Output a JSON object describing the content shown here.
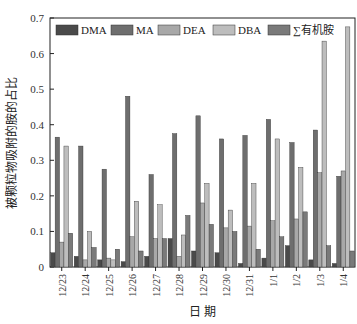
{
  "chart_data": {
    "type": "bar",
    "title": "",
    "xlabel": "日 期",
    "ylabel": "被颗粒物吸附的胺的占比",
    "ylim": [
      0,
      0.7
    ],
    "yticks": [
      0,
      0.1,
      0.2,
      0.3,
      0.4,
      0.5,
      0.6,
      0.7
    ],
    "grid": false,
    "legend_position": "top-inside",
    "categories": [
      "12/23",
      "12/24",
      "12/25",
      "12/26",
      "12/27",
      "12/28",
      "12/29",
      "12/30",
      "12/31",
      "1/1",
      "1/2",
      "1/3",
      "1/4"
    ],
    "series": [
      {
        "name": "DMA",
        "color": "#4a4a4a",
        "values": [
          0.04,
          0.03,
          0.02,
          0.015,
          0.03,
          0.08,
          0.045,
          0.04,
          0.01,
          0.025,
          0.06,
          0.02,
          0.01
        ]
      },
      {
        "name": "MA",
        "color": "#6e6e6e",
        "values": [
          0.365,
          0.34,
          0.275,
          0.48,
          0.26,
          0.375,
          0.425,
          0.36,
          0.37,
          0.415,
          0.35,
          0.385,
          0.255
        ]
      },
      {
        "name": "DEA",
        "color": "#a8a8a8",
        "values": [
          0.07,
          0.02,
          0.025,
          0.085,
          0.08,
          0.03,
          0.18,
          0.11,
          0.115,
          0.13,
          0.135,
          0.265,
          0.27
        ]
      },
      {
        "name": "DBA",
        "color": "#bdbdbd",
        "values": [
          0.34,
          0.1,
          0.02,
          0.185,
          0.175,
          0.09,
          0.235,
          0.16,
          0.235,
          0.36,
          0.28,
          0.635,
          0.675
        ]
      },
      {
        "name": "∑有机胺",
        "color": "#7a7a7a",
        "values": [
          0.095,
          0.055,
          0.05,
          0.045,
          0.08,
          0.145,
          0.12,
          0.1,
          0.05,
          0.085,
          0.155,
          0.06,
          0.045
        ]
      }
    ]
  }
}
